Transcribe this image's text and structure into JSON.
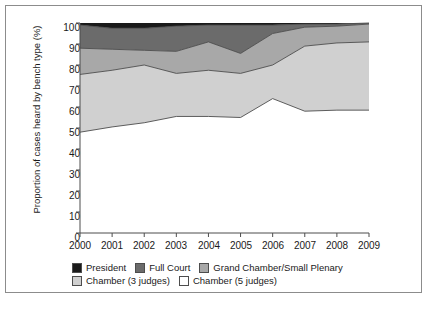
{
  "chart_data": {
    "type": "area",
    "title": "",
    "subtitle": "",
    "xlabel": "",
    "ylabel": "Proportion of cases heard by bench type (%)",
    "categories": [
      "2000",
      "2001",
      "2002",
      "2003",
      "2004",
      "2005",
      "2006",
      "2007",
      "2008",
      "2009"
    ],
    "x": [
      2000,
      2001,
      2002,
      2003,
      2004,
      2005,
      2006,
      2007,
      2008,
      2009
    ],
    "xlim": [
      2000,
      2009
    ],
    "ylim": [
      0,
      100
    ],
    "yticks": [
      0,
      10,
      20,
      30,
      40,
      50,
      60,
      70,
      80,
      90,
      100
    ],
    "grid": false,
    "legend_position": "bottom-left",
    "stacked": true,
    "stack_order_bottom_to_top": [
      "Chamber (5 judges)",
      "Chamber (3 judges)",
      "Grand Chamber/Small Plenary",
      "Full Court",
      "President"
    ],
    "series": [
      {
        "name": "Chamber (5 judges)",
        "color": "#ffffff",
        "values": [
          48.0,
          50.5,
          52.5,
          55.5,
          55.5,
          55.0,
          64.0,
          58.0,
          58.5,
          58.5
        ],
        "cumulative_top": [
          48.0,
          50.5,
          52.5,
          55.5,
          55.5,
          55.0,
          64.0,
          58.0,
          58.5,
          58.5
        ]
      },
      {
        "name": "Chamber (3 judges)",
        "color": "#d0d0d0",
        "values": [
          27.5,
          27.0,
          27.5,
          20.5,
          22.0,
          21.0,
          16.0,
          31.0,
          32.0,
          32.5
        ],
        "cumulative_top": [
          75.5,
          77.5,
          80.0,
          76.0,
          77.5,
          76.0,
          80.0,
          89.0,
          90.5,
          91.0
        ]
      },
      {
        "name": "Grand Chamber/Small Plenary",
        "color": "#a8a8a8",
        "values": [
          12.5,
          10.0,
          7.0,
          10.5,
          13.5,
          9.5,
          15.0,
          9.0,
          8.0,
          8.5
        ],
        "cumulative_top": [
          88.0,
          87.5,
          87.0,
          86.5,
          91.0,
          85.5,
          95.0,
          98.0,
          98.5,
          99.5
        ]
      },
      {
        "name": "Full Court",
        "color": "#6b6b6b",
        "values": [
          11.0,
          10.0,
          10.5,
          12.0,
          8.0,
          13.5,
          4.0,
          1.5,
          1.0,
          0.5
        ],
        "cumulative_top": [
          99.0,
          97.5,
          97.5,
          98.5,
          99.0,
          99.0,
          99.0,
          99.5,
          99.5,
          100.0
        ]
      },
      {
        "name": "President",
        "color": "#1a1a1a",
        "values": [
          1.0,
          2.5,
          2.5,
          1.5,
          1.0,
          1.0,
          1.0,
          0.5,
          0.5,
          0.0
        ],
        "cumulative_top": [
          100.0,
          100.0,
          100.0,
          100.0,
          100.0,
          100.0,
          100.0,
          100.0,
          100.0,
          100.0
        ]
      }
    ]
  },
  "legend": {
    "row1": [
      {
        "label": "President",
        "color": "#1a1a1a"
      },
      {
        "label": "Full Court",
        "color": "#6b6b6b"
      },
      {
        "label": "Grand Chamber/Small Plenary",
        "color": "#a8a8a8"
      }
    ],
    "row2": [
      {
        "label": "Chamber (3 judges)",
        "color": "#d0d0d0"
      },
      {
        "label": "Chamber (5 judges)",
        "color": "#ffffff"
      }
    ]
  },
  "axis": {
    "y_title": "Proportion of cases heard by bench type (%)",
    "y_ticks": [
      "100",
      "90",
      "80",
      "70",
      "60",
      "50",
      "40",
      "30",
      "20",
      "10",
      "0"
    ],
    "x_ticks": [
      "2000",
      "2001",
      "2002",
      "2003",
      "2004",
      "2005",
      "2006",
      "2007",
      "2008",
      "2009"
    ]
  },
  "colors": {
    "president": "#1a1a1a",
    "full_court": "#6b6b6b",
    "grand_chamber": "#a8a8a8",
    "chamber3": "#d0d0d0",
    "chamber5": "#ffffff",
    "frame": "#8c8c8c",
    "axis": "#4d4d4d",
    "text": "#1a1a1a"
  }
}
